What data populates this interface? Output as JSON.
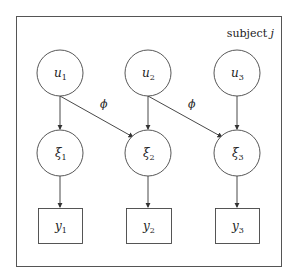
{
  "plate": {
    "label": "subject",
    "index": "j"
  },
  "latent_top": [
    {
      "sym": "u",
      "sub": "1"
    },
    {
      "sym": "u",
      "sub": "2"
    },
    {
      "sym": "u",
      "sub": "3"
    }
  ],
  "latent_mid": [
    {
      "sym": "ξ",
      "sub": "1"
    },
    {
      "sym": "ξ",
      "sub": "2"
    },
    {
      "sym": "ξ",
      "sub": "3"
    }
  ],
  "observed": [
    {
      "sym": "y",
      "sub": "1"
    },
    {
      "sym": "y",
      "sub": "2"
    },
    {
      "sym": "y",
      "sub": "3"
    }
  ],
  "edge_labels": {
    "cross_1": "ϕ",
    "cross_2": "ϕ"
  },
  "edges": [
    [
      "u1",
      "ξ1"
    ],
    [
      "u2",
      "ξ2"
    ],
    [
      "u3",
      "ξ3"
    ],
    [
      "u1",
      "ξ2"
    ],
    [
      "u2",
      "ξ3"
    ],
    [
      "ξ1",
      "y1"
    ],
    [
      "ξ2",
      "y2"
    ],
    [
      "ξ3",
      "y3"
    ]
  ]
}
